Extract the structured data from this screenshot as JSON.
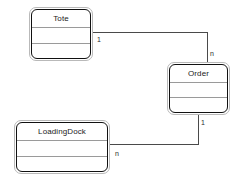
{
  "diagram": {
    "type": "uml-class-diagram",
    "background_color": "#ffffff",
    "classes": [
      {
        "id": "tote",
        "name": "Tote",
        "attributes_compartment": "",
        "operations_compartment": "",
        "x": 29,
        "y": 7,
        "width": 64,
        "height": 54
      },
      {
        "id": "order",
        "name": "Order",
        "attributes_compartment": "",
        "operations_compartment": "",
        "x": 167,
        "y": 62,
        "width": 63,
        "height": 53
      },
      {
        "id": "loadingdock",
        "name": "LoadingDock",
        "attributes_compartment": "",
        "operations_compartment": "",
        "x": 14,
        "y": 120,
        "width": 96,
        "height": 54
      }
    ],
    "associations": [
      {
        "id": "tote-order",
        "from": "tote",
        "to": "order",
        "from_multiplicity": "1",
        "to_multiplicity": "n",
        "line_color": "#4a4a4a",
        "path": "M 93 32 L 207 32 L 207 62"
      },
      {
        "id": "order-loadingdock",
        "from": "order",
        "to": "loadingdock",
        "from_multiplicity": "1",
        "to_multiplicity": "n",
        "line_color": "#4a4a4a",
        "path": "M 198 115 L 198 144 L 110 144"
      }
    ],
    "multiplicity_labels": [
      {
        "id": "tote-end",
        "text": "1",
        "x": 97,
        "y": 36
      },
      {
        "id": "order-top-end",
        "text": "n",
        "x": 210,
        "y": 50
      },
      {
        "id": "order-bottom-end",
        "text": "1",
        "x": 201,
        "y": 119
      },
      {
        "id": "loadingdock-end",
        "text": "n",
        "x": 115,
        "y": 150
      }
    ],
    "colors": {
      "class_border_outer": "#b9b9b9",
      "class_border_inner": "#111111",
      "compartment_divider": "#9a9a9a",
      "connector": "#4a4a4a",
      "text": "#1b1b1b",
      "canvas": "#ffffff"
    }
  }
}
